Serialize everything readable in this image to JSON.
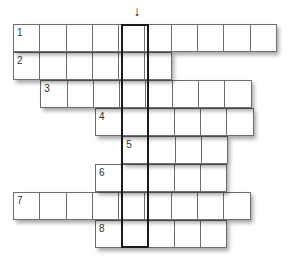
{
  "puzzle": {
    "columns": 10,
    "highlight_column": 4,
    "arrow_glyph": "↓",
    "rows": [
      {
        "number": "1",
        "start": 0,
        "length": 10
      },
      {
        "number": "2",
        "start": 0,
        "length": 6
      },
      {
        "number": "3",
        "start": 1,
        "length": 8
      },
      {
        "number": "4",
        "start": 3,
        "length": 6
      },
      {
        "number": "5",
        "start": 4,
        "length": 4
      },
      {
        "number": "6",
        "start": 3,
        "length": 5
      },
      {
        "number": "7",
        "start": 0,
        "length": 9
      },
      {
        "number": "8",
        "start": 3,
        "length": 5
      }
    ]
  }
}
